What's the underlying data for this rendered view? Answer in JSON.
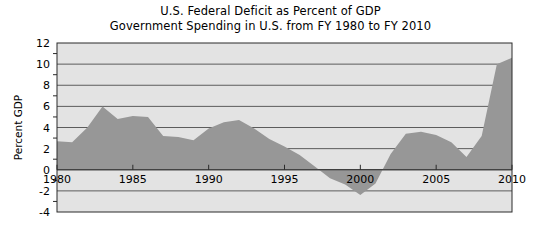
{
  "chart_data": {
    "type": "area",
    "title": "U.S. Federal Deficit as Percent of GDP",
    "subtitle": "Government Spending in U.S. from FY 1980 to FY 2010",
    "xlabel": "",
    "ylabel": "Percent GDP",
    "xlim": [
      1980,
      2010
    ],
    "ylim": [
      -4,
      12
    ],
    "xticks": [
      1980,
      1985,
      1990,
      1995,
      2000,
      2005,
      2010
    ],
    "xtick_labels": [
      "1980",
      "1985",
      "1990",
      "1995",
      "2000",
      "2005",
      "2010"
    ],
    "yticks": [
      -4,
      -2,
      0,
      2,
      4,
      6,
      8,
      10,
      12
    ],
    "ytick_labels": [
      "-4",
      "-2",
      "0",
      "2",
      "4",
      "6",
      "8",
      "10",
      "12"
    ],
    "minor_yticks": [
      -3,
      -1,
      1,
      3,
      5,
      7,
      9,
      11
    ],
    "grid": true,
    "grid_axis": "y",
    "legend": false,
    "baseline": 0,
    "x": [
      1980,
      1981,
      1982,
      1983,
      1984,
      1985,
      1986,
      1987,
      1988,
      1989,
      1990,
      1991,
      1992,
      1993,
      1994,
      1995,
      1996,
      1997,
      1998,
      1999,
      2000,
      2001,
      2002,
      2003,
      2004,
      2005,
      2006,
      2007,
      2008,
      2009,
      2010
    ],
    "values": [
      2.7,
      2.6,
      4.0,
      6.0,
      4.8,
      5.1,
      5.0,
      3.2,
      3.1,
      2.8,
      3.9,
      4.5,
      4.7,
      3.9,
      2.9,
      2.2,
      1.4,
      0.3,
      -0.8,
      -1.4,
      -2.4,
      -1.3,
      1.5,
      3.4,
      3.6,
      3.3,
      2.6,
      1.2,
      3.2,
      10.0,
      10.6
    ],
    "colors": {
      "area_fill": "#979797",
      "plot_background": "#e3e3e3",
      "gridline": "#4d4d4d",
      "axis_line": "#2b2b2b",
      "text": "#000000",
      "page_background": "#ffffff"
    }
  },
  "plot": {
    "frame_left": 57,
    "frame_right": 512,
    "frame_top": 43,
    "frame_bottom": 212
  }
}
